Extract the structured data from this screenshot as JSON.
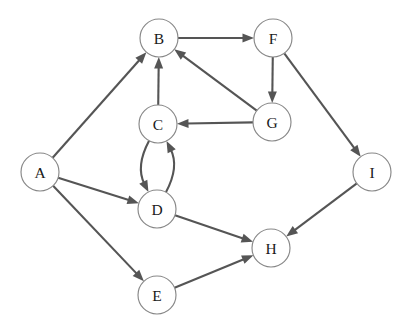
{
  "graph": {
    "title": "directed-graph",
    "background_color": "#ffffff",
    "node_fill_color": "#ffffff",
    "node_stroke_color": "#888888",
    "edge_color": "#555555",
    "label_color": "#1a1a1a",
    "node_radius": 19,
    "width": 408,
    "height": 332,
    "nodes": [
      {
        "id": "A",
        "label": "A",
        "x": 40,
        "y": 172
      },
      {
        "id": "B",
        "label": "B",
        "x": 159,
        "y": 38
      },
      {
        "id": "C",
        "label": "C",
        "x": 158,
        "y": 124
      },
      {
        "id": "D",
        "label": "D",
        "x": 157,
        "y": 209
      },
      {
        "id": "E",
        "label": "E",
        "x": 157,
        "y": 295
      },
      {
        "id": "F",
        "label": "F",
        "x": 273,
        "y": 38
      },
      {
        "id": "G",
        "label": "G",
        "x": 272,
        "y": 122
      },
      {
        "id": "H",
        "label": "H",
        "x": 271,
        "y": 248
      },
      {
        "id": "I",
        "label": "I",
        "x": 372,
        "y": 172
      }
    ],
    "edges": [
      {
        "from": "A",
        "to": "B",
        "directed": true,
        "curve": 0
      },
      {
        "from": "A",
        "to": "D",
        "directed": true,
        "curve": 0
      },
      {
        "from": "A",
        "to": "E",
        "directed": true,
        "curve": 0
      },
      {
        "from": "B",
        "to": "F",
        "directed": true,
        "curve": 0
      },
      {
        "from": "C",
        "to": "B",
        "directed": true,
        "curve": 0
      },
      {
        "from": "C",
        "to": "D",
        "directed": true,
        "curve": 22
      },
      {
        "from": "D",
        "to": "C",
        "directed": true,
        "curve": 22
      },
      {
        "from": "D",
        "to": "H",
        "directed": true,
        "curve": 0
      },
      {
        "from": "E",
        "to": "H",
        "directed": true,
        "curve": 0
      },
      {
        "from": "F",
        "to": "G",
        "directed": true,
        "curve": 0
      },
      {
        "from": "F",
        "to": "I",
        "directed": true,
        "curve": 0
      },
      {
        "from": "G",
        "to": "B",
        "directed": true,
        "curve": 0
      },
      {
        "from": "G",
        "to": "C",
        "directed": true,
        "curve": 0
      },
      {
        "from": "I",
        "to": "H",
        "directed": true,
        "curve": 0
      }
    ]
  }
}
